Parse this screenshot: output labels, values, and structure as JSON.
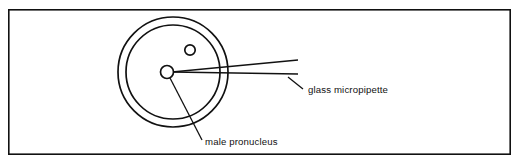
{
  "figure": {
    "background_color": "#ffffff",
    "ink_color": "#111111",
    "frame": {
      "name": "figure-border",
      "x": 8,
      "y": 9,
      "width": 503,
      "height": 146
    },
    "cell": {
      "center_x": 173,
      "center_y": 72,
      "outer_radius": 55,
      "inner_radius": 47
    },
    "male_pronucleus": {
      "center_x": 167,
      "center_y": 72,
      "radius": 6.5
    },
    "female_pronucleus": {
      "center_x": 190,
      "center_y": 50,
      "radius": 5.2
    },
    "micropipette": {
      "tip_x": 172,
      "tip_y": 72,
      "upper_end_x": 298,
      "upper_end_y": 60,
      "lower_end_x": 298,
      "lower_end_y": 74
    },
    "labels": [
      {
        "id": "glass-micropipette",
        "text": "glass micropipette",
        "text_x": 308,
        "text_y": 93,
        "leader": {
          "x1": 288,
          "y1": 77,
          "x2": 303,
          "y2": 89
        }
      },
      {
        "id": "male-pronucleus",
        "text": "male pronucleus",
        "text_x": 205,
        "text_y": 145,
        "leader": {
          "x1": 170,
          "y1": 78,
          "x2": 202,
          "y2": 140
        }
      }
    ]
  }
}
